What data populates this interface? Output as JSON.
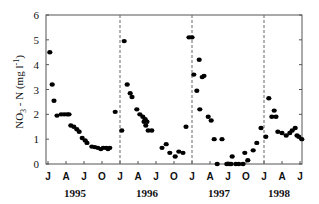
{
  "chart_data": {
    "type": "scatter",
    "title": "",
    "xlabel": "",
    "ylabel": "NO3 - N (mg l-1)",
    "ylabel_parts": {
      "main": "NO",
      "sub": "3",
      "mid": " - N (mg l",
      "sup": "-1",
      "end": ")"
    },
    "ylim": [
      0,
      6
    ],
    "yticks": [
      "0",
      "1",
      "2",
      "3",
      "4",
      "5",
      "6"
    ],
    "x_unit": "months since July 1995",
    "xlim": [
      0,
      36
    ],
    "xtick_labels": [
      "J",
      "A",
      "J",
      "O",
      "J",
      "A",
      "J",
      "O",
      "J",
      "A",
      "J",
      "O",
      "J",
      "A",
      "J"
    ],
    "year_labels": [
      {
        "label": "1995",
        "x_month": 4.5
      },
      {
        "label": "1996",
        "x_month": 16.5
      },
      {
        "label": "1997",
        "x_month": 28.5
      },
      {
        "label": "1998",
        "x_month": 38.5
      }
    ],
    "year_dividers_x_month": [
      12,
      24,
      36
    ],
    "grid": false,
    "legend": null,
    "series": [
      {
        "name": "NO3-N",
        "marker": "filled-circle",
        "color": "#000000",
        "points": [
          [
            0.3,
            4.5
          ],
          [
            0.7,
            3.2
          ],
          [
            1.0,
            2.55
          ],
          [
            1.5,
            1.95
          ],
          [
            2.2,
            2.0
          ],
          [
            2.7,
            2.0
          ],
          [
            3.2,
            2.0
          ],
          [
            3.5,
            2.0
          ],
          [
            3.8,
            1.55
          ],
          [
            4.3,
            1.5
          ],
          [
            4.8,
            1.4
          ],
          [
            5.2,
            1.3
          ],
          [
            5.7,
            1.05
          ],
          [
            6.2,
            0.95
          ],
          [
            6.5,
            0.85
          ],
          [
            7.3,
            0.7
          ],
          [
            7.8,
            0.68
          ],
          [
            8.3,
            0.65
          ],
          [
            8.8,
            0.6
          ],
          [
            9.2,
            0.65
          ],
          [
            9.7,
            0.65
          ],
          [
            10.0,
            0.6
          ],
          [
            10.3,
            0.65
          ],
          [
            11.2,
            2.1
          ],
          [
            12.3,
            1.35
          ],
          [
            12.7,
            4.95
          ],
          [
            13.2,
            3.2
          ],
          [
            13.7,
            2.85
          ],
          [
            14.0,
            2.7
          ],
          [
            14.8,
            2.2
          ],
          [
            15.3,
            2.0
          ],
          [
            15.8,
            1.9
          ],
          [
            16.2,
            1.8
          ],
          [
            16.0,
            1.7
          ],
          [
            16.5,
            1.7
          ],
          [
            16.3,
            1.55
          ],
          [
            16.7,
            1.35
          ],
          [
            17.3,
            1.35
          ],
          [
            19.0,
            0.65
          ],
          [
            19.7,
            0.8
          ],
          [
            20.3,
            0.45
          ],
          [
            21.2,
            0.3
          ],
          [
            21.8,
            0.5
          ],
          [
            22.5,
            0.45
          ],
          [
            23.0,
            1.5
          ],
          [
            23.5,
            5.1
          ],
          [
            24.0,
            5.1
          ],
          [
            24.3,
            3.6
          ],
          [
            25.2,
            4.2
          ],
          [
            24.8,
            2.95
          ],
          [
            25.7,
            3.5
          ],
          [
            26.0,
            3.55
          ],
          [
            25.3,
            2.2
          ],
          [
            26.7,
            1.9
          ],
          [
            27.2,
            1.75
          ],
          [
            27.7,
            1.0
          ],
          [
            28.2,
            0.0
          ],
          [
            29.0,
            1.0
          ],
          [
            29.8,
            0.0
          ],
          [
            30.2,
            0.0
          ],
          [
            30.5,
            0.0
          ],
          [
            30.7,
            0.3
          ],
          [
            31.3,
            0.0
          ],
          [
            31.8,
            0.0
          ],
          [
            32.5,
            0.0
          ],
          [
            32.8,
            0.45
          ],
          [
            33.3,
            0.15
          ],
          [
            34.2,
            0.55
          ],
          [
            34.8,
            0.85
          ],
          [
            35.5,
            1.45
          ],
          [
            36.3,
            1.1
          ],
          [
            36.8,
            2.65
          ],
          [
            37.3,
            1.9
          ],
          [
            37.7,
            2.15
          ],
          [
            38.0,
            1.9
          ],
          [
            38.3,
            1.3
          ],
          [
            39.0,
            1.25
          ],
          [
            39.7,
            1.15
          ],
          [
            40.3,
            1.25
          ],
          [
            40.7,
            1.35
          ],
          [
            41.2,
            1.45
          ],
          [
            41.5,
            1.15
          ],
          [
            41.8,
            1.1
          ],
          [
            42.3,
            1.0
          ]
        ]
      }
    ]
  }
}
